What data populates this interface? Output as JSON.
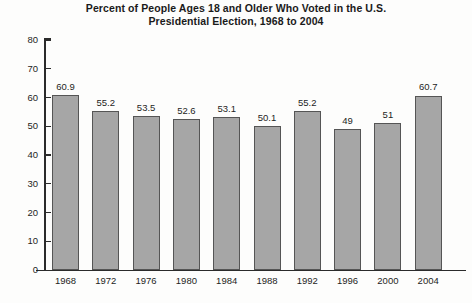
{
  "chart_data": {
    "type": "bar",
    "title": "Percent of People Ages 18 and Older Who Voted in the U.S. Presidential Election, 1968 to 2004",
    "title_lines": [
      "Percent of People Ages 18 and Older Who Voted in the U.S.",
      "Presidential Election, 1968 to 2004"
    ],
    "xlabel": "",
    "ylabel": "",
    "categories": [
      "1968",
      "1972",
      "1976",
      "1980",
      "1984",
      "1988",
      "1992",
      "1996",
      "2000",
      "2004"
    ],
    "values": [
      60.9,
      55.2,
      53.5,
      52.6,
      53.1,
      50.1,
      55.2,
      49,
      51,
      60.7
    ],
    "value_labels": [
      "60.9",
      "55.2",
      "53.5",
      "52.6",
      "53.1",
      "50.1",
      "55.2",
      "49",
      "51",
      "60.7"
    ],
    "ylim": [
      0,
      80
    ],
    "yticks": [
      0,
      10,
      20,
      30,
      40,
      50,
      60,
      70,
      80
    ],
    "ytick_labels": [
      "0",
      "10",
      "20",
      "30",
      "40",
      "50",
      "60",
      "70",
      "80"
    ],
    "grid": false,
    "legend": null,
    "legend_position": "none",
    "bar_fill_color": "#a6a6a6",
    "bar_border_color": "#555555",
    "axis_color": "#2b2b2b",
    "text_color": "#1d1d1d",
    "background_color": "#fdfdfc"
  }
}
